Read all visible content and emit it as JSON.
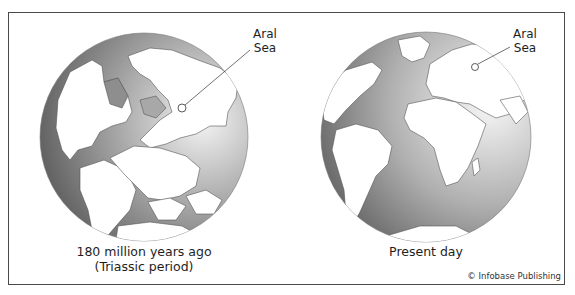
{
  "figure": {
    "panels": [
      {
        "id": "past",
        "caption_line1": "180 million years ago",
        "caption_line2": "(Triassic period)",
        "marker_label_line1": "Aral",
        "marker_label_line2": "Sea"
      },
      {
        "id": "present",
        "caption_line1": "Present day",
        "marker_label_line1": "Aral",
        "marker_label_line2": "Sea"
      }
    ],
    "credit": "© Infobase Publishing"
  },
  "colors": {
    "ocean_dark": "#5a5a5a",
    "ocean_light": "#f2f2f2",
    "land": "#ffffff",
    "shelf": "#9a9a9a",
    "border": "#4a4a4a"
  }
}
